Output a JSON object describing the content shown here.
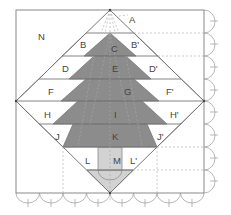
{
  "diagram": {
    "labels": {
      "A": "A",
      "N": "N",
      "B": "B",
      "C": "C",
      "Bp": "B'",
      "D": "D",
      "E": "E",
      "Dp": "D'",
      "F": "F",
      "G": "G",
      "Fp": "F'",
      "H": "H",
      "I": "I",
      "Hp": "H'",
      "J": "J",
      "K": "K",
      "Jp": "J'",
      "L": "L",
      "M": "M",
      "Lp": "L'"
    },
    "colors": {
      "outline": "#777777",
      "tree": "#8a8a8a",
      "trunk": "#cfcfcf",
      "background": "#ffffff",
      "dashed": "#aaaaaa"
    }
  }
}
